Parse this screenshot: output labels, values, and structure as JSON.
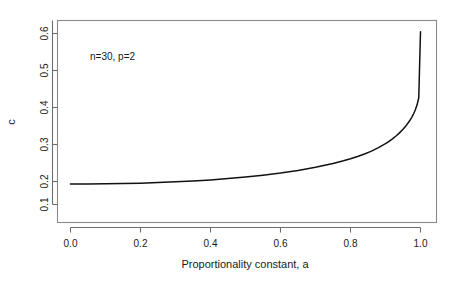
{
  "figure": {
    "background_color": "#ffffff",
    "frame_color": "#8a8a8a",
    "curve_color": "#111111",
    "annotation": "n=30, p=2"
  },
  "axes": {
    "x_title": "Proportionality constant, a",
    "y_title": "c",
    "x_ticks": [
      "0.0",
      "0.2",
      "0.4",
      "0.6",
      "0.8",
      "1.0"
    ],
    "y_ticks": [
      "0.1",
      "0.2",
      "0.3",
      "0.4",
      "0.5",
      "0.6"
    ]
  },
  "chart_data": {
    "type": "line",
    "title": "",
    "subtitle": "",
    "xlabel": "Proportionality constant, a",
    "ylabel": "c",
    "xlim": [
      -0.04,
      1.04
    ],
    "ylim": [
      0.075,
      0.625
    ],
    "xticks": [
      0.0,
      0.2,
      0.4,
      0.6,
      0.8,
      1.0
    ],
    "yticks": [
      0.1,
      0.2,
      0.3,
      0.4,
      0.5,
      0.6
    ],
    "xticklabels": [
      "0.0",
      "0.2",
      "0.4",
      "0.6",
      "0.8",
      "1.0"
    ],
    "yticklabels": [
      "0.1",
      "0.2",
      "0.3",
      "0.4",
      "0.5",
      "0.6"
    ],
    "grid": false,
    "legend": null,
    "annotations": [
      {
        "text": "n=30, p=2",
        "x": 0.06,
        "y": 0.535
      }
    ],
    "series": [
      {
        "name": "c",
        "x": [
          0.0,
          0.05,
          0.1,
          0.15,
          0.2,
          0.25,
          0.3,
          0.35,
          0.4,
          0.45,
          0.5,
          0.55,
          0.6,
          0.65,
          0.7,
          0.75,
          0.78,
          0.8,
          0.82,
          0.84,
          0.86,
          0.88,
          0.9,
          0.91,
          0.92,
          0.93,
          0.94,
          0.95,
          0.96,
          0.97,
          0.975,
          0.98,
          0.985,
          0.99,
          0.995,
          1.0
        ],
        "y": [
          0.193,
          0.1932,
          0.1936,
          0.1944,
          0.1955,
          0.197,
          0.199,
          0.2014,
          0.2043,
          0.2078,
          0.212,
          0.217,
          0.2229,
          0.2299,
          0.2383,
          0.2486,
          0.2559,
          0.2613,
          0.2674,
          0.2743,
          0.2822,
          0.2914,
          0.3022,
          0.3084,
          0.3153,
          0.3229,
          0.3314,
          0.3411,
          0.3523,
          0.3656,
          0.3734,
          0.3824,
          0.3931,
          0.4065,
          0.4258,
          0.605
        ]
      }
    ]
  }
}
